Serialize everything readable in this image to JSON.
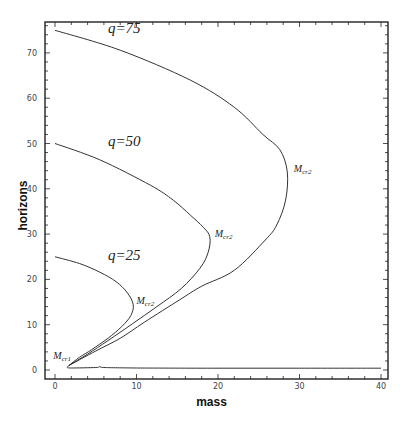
{
  "chart_data": {
    "type": "line",
    "title": "",
    "xlabel": "mass",
    "ylabel": "horizons",
    "xlim": [
      -1.2,
      41
    ],
    "ylim": [
      -2,
      77
    ],
    "xticks": [
      0,
      10,
      20,
      30,
      40
    ],
    "yticks": [
      0,
      10,
      20,
      30,
      40,
      50,
      60,
      70
    ],
    "minor_tick_step": 2,
    "grid": false,
    "legend": "none",
    "series": [
      {
        "name": "q=75",
        "points": [
          [
            0,
            75
          ],
          [
            8,
            70.6
          ],
          [
            16.6,
            64
          ],
          [
            22,
            58
          ],
          [
            25.5,
            52
          ],
          [
            27.6,
            48.6
          ],
          [
            28.5,
            43.7
          ],
          [
            28.3,
            37.5
          ],
          [
            27.2,
            32
          ],
          [
            25.8,
            28.7
          ],
          [
            22,
            22
          ],
          [
            18,
            18.5
          ],
          [
            15.3,
            15.5
          ],
          [
            11,
            10.6
          ],
          [
            8,
            7
          ],
          [
            5,
            4.2
          ],
          [
            1.7,
            1
          ]
        ]
      },
      {
        "name": "q=50",
        "points": [
          [
            0,
            50
          ],
          [
            5.5,
            46.4
          ],
          [
            11.7,
            40.8
          ],
          [
            14.5,
            37.5
          ],
          [
            16.6,
            34.2
          ],
          [
            18.2,
            31.5
          ],
          [
            19,
            29.4
          ],
          [
            18.8,
            26
          ],
          [
            17.8,
            22.5
          ],
          [
            15.5,
            18
          ],
          [
            12.5,
            14
          ],
          [
            9.5,
            10.2
          ],
          [
            6.5,
            6.5
          ],
          [
            4,
            3.5
          ],
          [
            1.7,
            1
          ]
        ]
      },
      {
        "name": "q=25",
        "points": [
          [
            0,
            25
          ],
          [
            3,
            23.5
          ],
          [
            5.5,
            21.6
          ],
          [
            7.5,
            19.5
          ],
          [
            8.9,
            17
          ],
          [
            9.6,
            14.4
          ],
          [
            9.3,
            12
          ],
          [
            8.2,
            9.6
          ],
          [
            6.5,
            7
          ],
          [
            4.5,
            4.5
          ],
          [
            3,
            2.8
          ],
          [
            1.7,
            1
          ]
        ]
      },
      {
        "name": "lower-branch",
        "points": [
          [
            1.7,
            1
          ],
          [
            1.5,
            0.6
          ],
          [
            2,
            0.45
          ],
          [
            5,
            0.55
          ],
          [
            5.5,
            0.75
          ],
          [
            6,
            0.55
          ],
          [
            10,
            0.45
          ],
          [
            20,
            0.4
          ],
          [
            30,
            0.4
          ],
          [
            40,
            0.4
          ]
        ]
      }
    ],
    "annotations": [
      {
        "text": "q=75",
        "x": 6.5,
        "y": 74.5,
        "size": "large"
      },
      {
        "text": "q=50",
        "x": 6.5,
        "y": 49.5,
        "size": "large"
      },
      {
        "text": "q=25",
        "x": 6.5,
        "y": 24.3,
        "size": "large"
      },
      {
        "text": "M",
        "sub": "cr1",
        "x": -0.2,
        "y": 2.5,
        "size": "small"
      },
      {
        "text": "M",
        "sub": "cr2",
        "x": 10,
        "y": 14.5,
        "size": "small"
      },
      {
        "text": "M",
        "sub": "cr2",
        "x": 19.6,
        "y": 29.3,
        "size": "small"
      },
      {
        "text": "M",
        "sub": "cr2",
        "x": 29.3,
        "y": 43.6,
        "size": "small"
      }
    ]
  }
}
